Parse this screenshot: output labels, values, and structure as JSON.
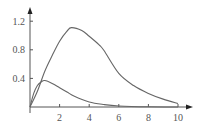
{
  "chart_data": {
    "type": "line",
    "title": "",
    "xlabel": "",
    "ylabel": "",
    "xlim": [
      0,
      10.5
    ],
    "ylim": [
      0,
      1.35
    ],
    "grid": false,
    "legend": null,
    "x_ticks": [
      "2",
      "4",
      "6",
      "8",
      "10"
    ],
    "y_ticks": [
      "0.4",
      "0.8",
      "1.2"
    ],
    "series": [
      {
        "name": "large curve",
        "x": [
          0,
          0.5,
          1,
          1.5,
          2,
          2.5,
          2.8,
          3.5,
          4,
          4.67,
          5,
          6,
          7,
          8,
          9,
          10
        ],
        "values": [
          0,
          0.22,
          0.5,
          0.72,
          0.92,
          1.06,
          1.11,
          1.07,
          0.99,
          0.87,
          0.79,
          0.47,
          0.3,
          0.19,
          0.11,
          0.05
        ]
      },
      {
        "name": "small curve",
        "x": [
          0,
          0.25,
          0.5,
          0.75,
          1,
          1.5,
          2,
          2.5,
          3,
          4,
          5,
          6,
          8,
          10
        ],
        "values": [
          0,
          0.19,
          0.3,
          0.35,
          0.37,
          0.33,
          0.27,
          0.21,
          0.15,
          0.07,
          0.034,
          0.015,
          0.003,
          0.0
        ]
      }
    ]
  },
  "colors": {
    "axis": "#555555",
    "curve": "#666666"
  }
}
